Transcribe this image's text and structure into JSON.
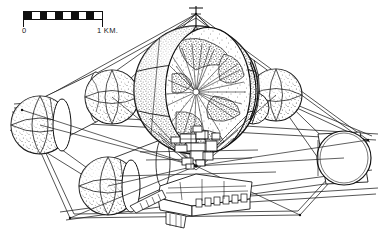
{
  "figure": {
    "medium": "black ink line art with stipple shading on white"
  },
  "scalebar": {
    "label_left": "0",
    "label_right": "1 KM.",
    "segments": [
      "on",
      "off",
      "on",
      "off",
      "on",
      "off",
      "on",
      "off",
      "on",
      "off"
    ],
    "segment_count": 10
  },
  "colors": {
    "ink": "#101010",
    "paper": "#ffffff",
    "stipple": "#2a2a2a",
    "hairline": "#353535"
  },
  "modules": [
    {
      "name": "main-sphere-cutaway",
      "kind": "sphere",
      "cx": 196,
      "cy": 90,
      "r": 62,
      "note": "large stippled sphere, open cutaway face with radiating starburst interior and mast at apex"
    },
    {
      "name": "upper-left-sphere",
      "kind": "sphere",
      "cx": 112,
      "cy": 97,
      "r": 27
    },
    {
      "name": "upper-right-sphere",
      "kind": "sphere",
      "cx": 276,
      "cy": 95,
      "r": 26
    },
    {
      "name": "left-sphere-cylinder",
      "kind": "sphere-cylinder",
      "cx": 40,
      "cy": 125,
      "r": 29
    },
    {
      "name": "lower-left-sphere-cylinder",
      "kind": "sphere-cylinder",
      "cx": 108,
      "cy": 186,
      "r": 29
    },
    {
      "name": "right-cylinder",
      "kind": "cylinder",
      "cx": 344,
      "cy": 158,
      "r": 27
    },
    {
      "name": "central-machinery",
      "kind": "structure",
      "cx": 196,
      "cy": 170,
      "note": "dense blocky hub assembly below the main sphere"
    },
    {
      "name": "lower-platform",
      "kind": "structure",
      "cx": 205,
      "cy": 205,
      "note": "stepped deck with crenellated edge and radiator fins"
    }
  ]
}
